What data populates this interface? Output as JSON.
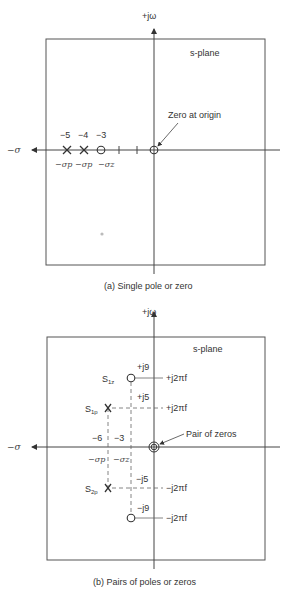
{
  "panel_a": {
    "axis_y_label": "+jω",
    "axis_x_label": "−σ",
    "plane_label": "s-plane",
    "annotation": "Zero at origin",
    "values": [
      "−5",
      "−4",
      "−3"
    ],
    "symbols": [
      "−σp",
      "−σp",
      "−σz"
    ],
    "caption": "(a)  Single pole or zero"
  },
  "panel_b": {
    "axis_y_label": "+jω",
    "axis_x_label": "−σ",
    "plane_label": "s-plane",
    "annotation": "Pair of zeros",
    "s1z": "S1z",
    "s1p": "S1p",
    "s2p": "S2p",
    "pos_j9": "+j9",
    "pos_j5": "+j5",
    "neg_j5": "−j5",
    "neg_j9": "−j9",
    "freq_pos_1": "+j2πf",
    "freq_pos_2": "+j2πf",
    "freq_neg_1": "−j2πf",
    "freq_neg_2": "−j2πf",
    "sigma_p_value": "−6",
    "sigma_z_value": "−3",
    "sigma_p": "−σp",
    "sigma_z": "−σz",
    "caption": "(b)  Pairs of poles or zeros"
  }
}
